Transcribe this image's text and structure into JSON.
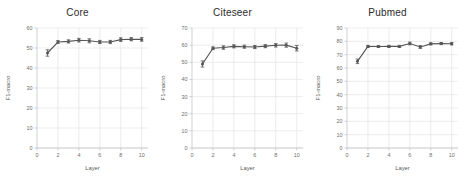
{
  "figure": {
    "panel_count": 3,
    "series_color": "#555555",
    "grid_color": "#d9d9d9",
    "axis_color": "#bdbdbd",
    "background": "#ffffff"
  },
  "chart_data": [
    {
      "type": "line",
      "title": "Core",
      "xlabel": "Layer",
      "ylabel": "F1-macro",
      "x": [
        1,
        2,
        3,
        4,
        5,
        6,
        7,
        8,
        9,
        10
      ],
      "values": [
        47.5,
        53.0,
        53.3,
        53.9,
        53.6,
        53.0,
        53.0,
        54.2,
        54.4,
        54.3
      ],
      "yerr": [
        1.6,
        0.7,
        0.8,
        0.9,
        1.0,
        0.8,
        0.8,
        0.9,
        0.8,
        0.9
      ],
      "xlim": [
        0,
        10.6
      ],
      "ylim": [
        0,
        60
      ],
      "xticks": [
        0,
        2,
        4,
        6,
        8,
        10
      ],
      "yticks": [
        0,
        10,
        20,
        30,
        40,
        50,
        60
      ],
      "grid": true,
      "legend": "none"
    },
    {
      "type": "line",
      "title": "Citeseer",
      "xlabel": "Layer",
      "ylabel": "F1-macro",
      "x": [
        1,
        2,
        3,
        4,
        5,
        6,
        7,
        8,
        9,
        10
      ],
      "values": [
        49.0,
        58.2,
        58.6,
        59.3,
        59.1,
        58.9,
        59.4,
        59.9,
        60.0,
        58.2
      ],
      "yerr": [
        1.8,
        0.8,
        1.0,
        0.9,
        0.9,
        0.9,
        0.9,
        1.0,
        1.2,
        1.6
      ],
      "xlim": [
        0,
        10.6
      ],
      "ylim": [
        0,
        70
      ],
      "xticks": [
        0,
        2,
        4,
        6,
        8,
        10
      ],
      "yticks": [
        0,
        10,
        20,
        30,
        40,
        50,
        60,
        70
      ],
      "grid": true,
      "legend": "none"
    },
    {
      "type": "line",
      "title": "Pubmed",
      "xlabel": "Layer",
      "ylabel": "F1-macro",
      "x": [
        1,
        2,
        3,
        4,
        5,
        6,
        7,
        8,
        9,
        10
      ],
      "values": [
        65.0,
        76.2,
        76.1,
        76.2,
        76.2,
        78.4,
        75.8,
        78.1,
        78.3,
        78.2
      ],
      "yerr": [
        1.7,
        0.8,
        0.7,
        0.8,
        0.8,
        1.0,
        1.1,
        0.8,
        0.8,
        0.9
      ],
      "xlim": [
        0,
        10.6
      ],
      "ylim": [
        0,
        90
      ],
      "xticks": [
        0,
        2,
        4,
        6,
        8,
        10
      ],
      "yticks": [
        0,
        10,
        20,
        30,
        40,
        50,
        60,
        70,
        80,
        90
      ],
      "grid": true,
      "legend": "none"
    }
  ]
}
